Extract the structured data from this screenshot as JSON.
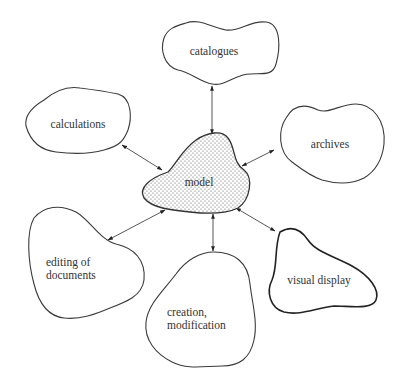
{
  "diagram": {
    "center": {
      "id": "model",
      "label": "model",
      "style": "dotted-fill"
    },
    "nodes": [
      {
        "id": "catalogues",
        "label": [
          "catalogues"
        ]
      },
      {
        "id": "calculations",
        "label": [
          "calculations"
        ]
      },
      {
        "id": "archives",
        "label": [
          "archives"
        ]
      },
      {
        "id": "editing",
        "label": [
          "editing of",
          "documents"
        ]
      },
      {
        "id": "creation",
        "label": [
          "creation,",
          "modification"
        ]
      },
      {
        "id": "visual",
        "label": [
          "visual display"
        ]
      }
    ],
    "edges": [
      {
        "from": "model",
        "to": "catalogues",
        "arrows": "both"
      },
      {
        "from": "model",
        "to": "calculations",
        "arrows": "both"
      },
      {
        "from": "model",
        "to": "archives",
        "arrows": "both"
      },
      {
        "from": "model",
        "to": "editing",
        "arrows": "both"
      },
      {
        "from": "model",
        "to": "creation",
        "arrows": "both"
      },
      {
        "from": "model",
        "to": "visual",
        "arrows": "both"
      }
    ]
  }
}
